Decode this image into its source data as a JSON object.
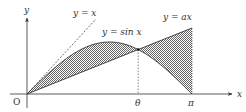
{
  "diagram": {
    "type": "function-graph",
    "axes": {
      "x_label": "x",
      "y_label": "y",
      "origin_label": "O"
    },
    "curves": [
      {
        "id": "line-y-eq-x",
        "label": "y = x",
        "style": "dashed"
      },
      {
        "id": "sine-curve",
        "label": "y = sin x",
        "style": "solid"
      },
      {
        "id": "line-y-eq-ax",
        "label": "y = ax",
        "style": "solid"
      }
    ],
    "x_ticks": [
      {
        "label": "θ",
        "value": "theta"
      },
      {
        "label": "π",
        "value": "pi"
      }
    ],
    "shaded_regions": "between y = sin x and y = ax on [0, π]",
    "colors": {
      "stroke": "#333333",
      "hatch": "#555555"
    }
  }
}
